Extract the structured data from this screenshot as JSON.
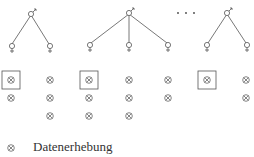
{
  "diagram": {
    "colors": {
      "line": "#555555",
      "symbol": "#666666",
      "text": "#333333"
    },
    "ellipsis": "· · ·",
    "trees": [
      {
        "male": [
          31,
          13
        ],
        "females": [
          [
            11,
            47
          ],
          [
            50,
            47
          ]
        ]
      },
      {
        "male": [
          129,
          12
        ],
        "females": [
          [
            90,
            46
          ],
          [
            129,
            46
          ],
          [
            168,
            46
          ]
        ]
      },
      {
        "male": [
          227,
          12
        ],
        "females": [
          [
            207,
            46
          ],
          [
            247,
            46
          ]
        ]
      }
    ],
    "columns": [
      {
        "x": 11,
        "counts": 2,
        "boxed_first": true
      },
      {
        "x": 50,
        "counts": 3,
        "boxed_first": false
      },
      {
        "x": 89,
        "counts": 3,
        "boxed_first": true
      },
      {
        "x": 129,
        "counts": 3,
        "boxed_first": false
      },
      {
        "x": 168,
        "counts": 2,
        "boxed_first": false
      },
      {
        "x": 207,
        "counts": 1,
        "boxed_first": true
      },
      {
        "x": 246,
        "counts": 2,
        "boxed_first": false
      }
    ]
  },
  "legend": {
    "symbol": "⊗",
    "label": "Datenerhebung"
  }
}
